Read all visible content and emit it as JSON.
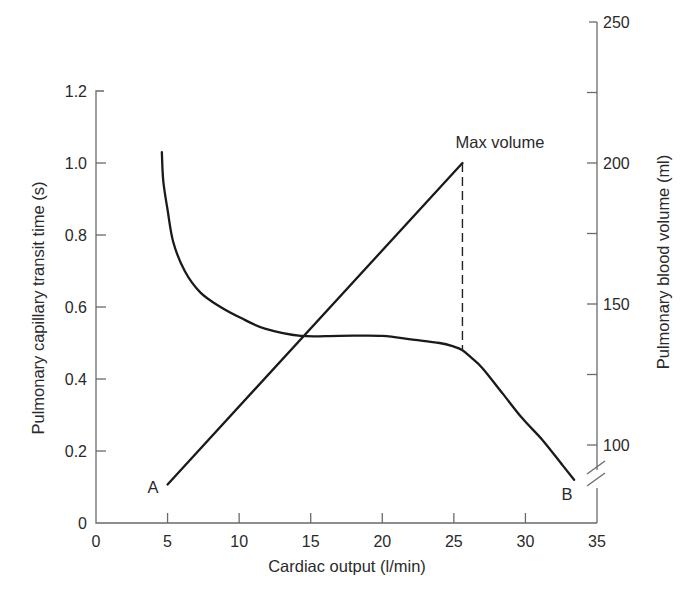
{
  "chart_data": {
    "type": "line",
    "title": "",
    "xlabel": "Cardiac output (l/min)",
    "ylabel_left": "Pulmonary capillary transit time (s)",
    "ylabel_right": "Pulmonary blood volume (ml)",
    "xlim": [
      0,
      35
    ],
    "ylim_left": [
      0,
      1.2
    ],
    "ylim_right": [
      100,
      250
    ],
    "x_ticks": [
      "0",
      "5",
      "10",
      "15",
      "20",
      "25",
      "30",
      "35"
    ],
    "y_left_ticks": [
      "0",
      "0.2",
      "0.4",
      "0.6",
      "0.8",
      "1.0",
      "1.2"
    ],
    "y_right_ticks": [
      "100",
      "150",
      "200",
      "250"
    ],
    "y_right_minor_ticks": [
      125,
      175,
      225
    ],
    "right_axis_break": true,
    "grid": false,
    "series": [
      {
        "name": "Pulmonary capillary transit time",
        "axis": "left",
        "x": [
          4.6,
          4.7,
          5.0,
          5.4,
          6.2,
          7.3,
          8.7,
          10.1,
          11.8,
          14.3,
          17.0,
          20.0,
          22.0,
          24.0,
          25.0,
          25.6,
          26.2,
          27.0,
          28.4,
          29.8,
          31.2,
          32.6,
          33.4
        ],
        "y": [
          1.03,
          0.95,
          0.87,
          0.78,
          0.7,
          0.64,
          0.6,
          0.57,
          0.54,
          0.52,
          0.52,
          0.52,
          0.51,
          0.5,
          0.49,
          0.48,
          0.46,
          0.43,
          0.36,
          0.29,
          0.23,
          0.16,
          0.12
        ]
      },
      {
        "name": "Pulmonary blood volume",
        "axis": "right",
        "x": [
          5.0,
          25.6
        ],
        "y": [
          86,
          200
        ]
      }
    ],
    "annotations": [
      {
        "text": "A",
        "x": 4.0,
        "y_left": 0.1,
        "note": "start of volume line"
      },
      {
        "text": "B",
        "x": 33.0,
        "y_left": 0.08,
        "note": "end of transit time curve"
      },
      {
        "text": "Max volume",
        "x": 25.6,
        "y_right": 200,
        "note": "dashed vertical line drops to transit curve"
      }
    ]
  },
  "labels": {
    "xlabel": "Cardiac output (l/min)",
    "ylabel_left": "Pulmonary capillary transit time (s)",
    "ylabel_right": "Pulmonary blood volume (ml)",
    "point_a": "A",
    "point_b": "B",
    "max_volume": "Max volume"
  }
}
